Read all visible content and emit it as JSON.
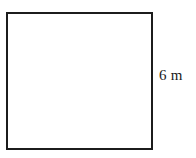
{
  "figure": {
    "name": "square-with-side-label",
    "type": "geometry-diagram",
    "background_color": "#ffffff"
  },
  "shape": {
    "name": "square",
    "kind": "square",
    "stroke_color": "#1c1c1c",
    "fill_color": "#ffffff",
    "stroke_width_px": 2,
    "x_px": 6,
    "y_px": 12,
    "width_px": 145,
    "height_px": 136
  },
  "labels": {
    "right_side": {
      "text": "6 m",
      "value": "6",
      "unit": "m",
      "attached_to": "right-side",
      "color": "#1a1a1a"
    }
  }
}
